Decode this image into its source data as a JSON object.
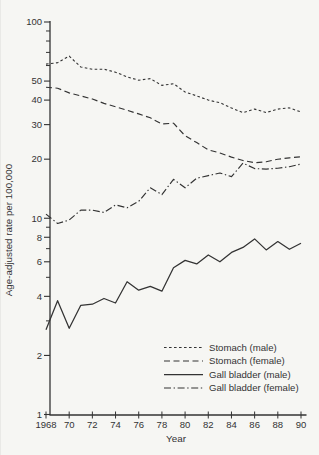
{
  "colors": {
    "ink": "#333333",
    "paper": "#f6f6f3"
  },
  "chart_data": {
    "type": "line",
    "title": "",
    "xlabel": "Year",
    "ylabel": "Age-adjusted rate per 100,000",
    "y_scale": "log",
    "ylim": [
      1,
      100
    ],
    "y_major_ticks": [
      1,
      2,
      4,
      6,
      8,
      10,
      20,
      30,
      40,
      50,
      100
    ],
    "y_major_tick_labels": [
      "1",
      "2",
      "4",
      "6",
      "8",
      "10",
      "20",
      "30",
      "40",
      "50",
      "100"
    ],
    "y_minor_ticks": [
      3,
      5,
      7,
      9,
      60,
      70,
      80,
      90
    ],
    "x": [
      1968,
      1969,
      1970,
      1971,
      1972,
      1973,
      1974,
      1975,
      1976,
      1977,
      1978,
      1979,
      1980,
      1981,
      1982,
      1983,
      1984,
      1985,
      1986,
      1987,
      1988,
      1989,
      1990
    ],
    "x_ticks": [
      1968,
      1970,
      1972,
      1974,
      1976,
      1978,
      1980,
      1982,
      1984,
      1986,
      1988,
      1990
    ],
    "x_tick_labels": [
      "1968",
      "70",
      "72",
      "74",
      "76",
      "78",
      "80",
      "82",
      "84",
      "86",
      "88",
      "90"
    ],
    "grid": false,
    "legend_position": "lower-right",
    "series": [
      {
        "name": "Stomach (male)",
        "dash": "short-dash",
        "values": [
          61,
          62,
          67,
          59,
          57.5,
          57.5,
          55.5,
          52.5,
          50.5,
          51.5,
          47.5,
          48.5,
          44,
          42,
          40,
          38.8,
          36.5,
          34.5,
          36,
          34.6,
          36,
          36.5,
          34.8
        ]
      },
      {
        "name": "Stomach (female)",
        "dash": "long-dash",
        "values": [
          46.5,
          46,
          43.5,
          42,
          40.5,
          38.5,
          37,
          35.5,
          34,
          32.5,
          30.2,
          30.5,
          26.3,
          24.3,
          22.3,
          21.5,
          20.5,
          19.7,
          19.2,
          19.4,
          20,
          20.3,
          20.6
        ]
      },
      {
        "name": "Gall bladder (male)",
        "dash": "solid",
        "values": [
          2.7,
          3.8,
          2.75,
          3.6,
          3.65,
          3.9,
          3.7,
          4.75,
          4.3,
          4.5,
          4.25,
          5.6,
          6.1,
          5.85,
          6.5,
          6,
          6.7,
          7.1,
          7.85,
          6.9,
          7.6,
          6.95,
          7.45
        ]
      },
      {
        "name": "Gall bladder (female)",
        "dash": "dash-dot",
        "values": [
          10.5,
          9.4,
          9.8,
          11,
          11,
          10.7,
          11.7,
          11.3,
          12.2,
          14.3,
          13.2,
          15.8,
          14.3,
          16,
          16.5,
          17,
          16.3,
          19.1,
          17.9,
          17.8,
          18,
          18.3,
          18.9
        ]
      }
    ]
  }
}
